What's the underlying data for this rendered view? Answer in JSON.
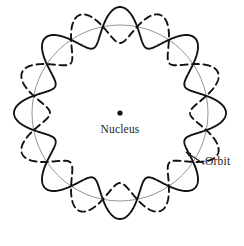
{
  "figure": {
    "background_color": "#ffffff",
    "width": 244,
    "height": 246,
    "center": {
      "x": 120,
      "y": 113
    }
  },
  "geometry": {
    "reference_circle": {
      "radius": 88,
      "color": "#777777",
      "stroke_width": 0.8,
      "style": "solid"
    },
    "standing_waves": [
      {
        "name": "solid-wave",
        "harmonic_number": 8,
        "base_radius": 88,
        "amplitude": 18,
        "phase_degrees": 0,
        "color": "#121212",
        "stroke_width": 1.9,
        "style": "solid",
        "dash_pattern": ""
      },
      {
        "name": "dashed-wave",
        "harmonic_number": 8,
        "base_radius": 88,
        "amplitude": 18,
        "phase_degrees": 22.5,
        "color": "#121212",
        "stroke_width": 1.9,
        "style": "dashed",
        "dash_pattern": "7,4.5"
      }
    ],
    "node_count": 8,
    "node_angles_degrees": [
      11.25,
      56.25,
      101.25,
      146.25,
      191.25,
      236.25,
      281.25,
      326.25
    ]
  },
  "nucleus": {
    "marker_label": "nucleus-dot",
    "marker_radius": 2.6,
    "marker_color": "#111111",
    "marker_x": 120,
    "marker_y": 113,
    "label": "Nucleus",
    "label_x": 120,
    "label_y": 133
  },
  "orbit": {
    "label": "Orbit",
    "label_x": 205,
    "label_y": 165,
    "leader_color": "#1a1a1a",
    "leader_stroke_width": 1.1,
    "leader_start": {
      "x": 204,
      "y": 164
    },
    "leader_end": {
      "x": 186,
      "y": 152
    },
    "arrow_head_size": 5.5
  },
  "colors": {
    "ink": "#121212",
    "reference_gray": "#777777",
    "text": "#1a1a1a",
    "background": "#ffffff"
  }
}
